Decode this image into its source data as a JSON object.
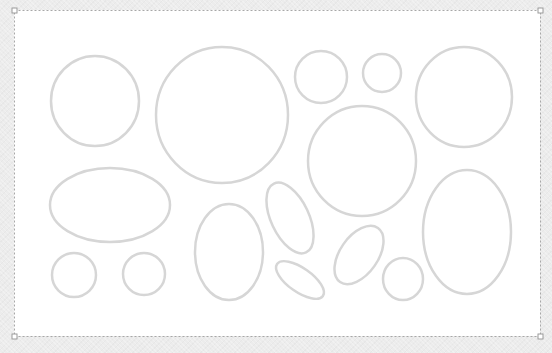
{
  "canvas": {
    "width": 552,
    "height": 353,
    "background": "#ececec",
    "slide": {
      "x": 14,
      "y": 10,
      "width": 526,
      "height": 326,
      "fill": "#ffffff",
      "border_color": "#a8a8a8",
      "handle_color": "#9a9a9a"
    },
    "shape_style": {
      "stroke": "#d6d6d6",
      "stroke_width": 2.5,
      "fill": "none"
    },
    "shapes": [
      {
        "name": "circle-top-left",
        "type": "ellipse",
        "cx": 95,
        "cy": 101,
        "rx": 44,
        "ry": 45,
        "rotate": 0
      },
      {
        "name": "circle-large",
        "type": "ellipse",
        "cx": 222,
        "cy": 115,
        "rx": 66,
        "ry": 68,
        "rotate": 0
      },
      {
        "name": "circle-small-top",
        "type": "ellipse",
        "cx": 321,
        "cy": 77,
        "rx": 26,
        "ry": 26,
        "rotate": 0
      },
      {
        "name": "circle-tiny-top",
        "type": "ellipse",
        "cx": 382,
        "cy": 73,
        "rx": 19,
        "ry": 19,
        "rotate": 0
      },
      {
        "name": "circle-top-right",
        "type": "ellipse",
        "cx": 464,
        "cy": 97,
        "rx": 48,
        "ry": 50,
        "rotate": 0
      },
      {
        "name": "circle-middle",
        "type": "ellipse",
        "cx": 362,
        "cy": 161,
        "rx": 54,
        "ry": 55,
        "rotate": 0
      },
      {
        "name": "ellipse-horizontal",
        "type": "ellipse",
        "cx": 110,
        "cy": 205,
        "rx": 60,
        "ry": 37,
        "rotate": 0
      },
      {
        "name": "circle-small-bottom-1",
        "type": "ellipse",
        "cx": 74,
        "cy": 275,
        "rx": 22,
        "ry": 22,
        "rotate": 0
      },
      {
        "name": "circle-small-bottom-2",
        "type": "ellipse",
        "cx": 144,
        "cy": 274,
        "rx": 21,
        "ry": 21,
        "rotate": 0
      },
      {
        "name": "ellipse-vertical",
        "type": "ellipse",
        "cx": 229,
        "cy": 252,
        "rx": 34,
        "ry": 48,
        "rotate": 0
      },
      {
        "name": "ellipse-tilted-upper",
        "type": "ellipse",
        "cx": 290,
        "cy": 218,
        "rx": 19,
        "ry": 38,
        "rotate": -25
      },
      {
        "name": "ellipse-tilted-lower",
        "type": "ellipse",
        "cx": 300,
        "cy": 280,
        "rx": 28,
        "ry": 12,
        "rotate": 35
      },
      {
        "name": "ellipse-tilted-right",
        "type": "ellipse",
        "cx": 359,
        "cy": 255,
        "rx": 19,
        "ry": 33,
        "rotate": 35
      },
      {
        "name": "circle-small-bottom-3",
        "type": "ellipse",
        "cx": 403,
        "cy": 279,
        "rx": 20,
        "ry": 21,
        "rotate": 0
      },
      {
        "name": "ellipse-tall-right",
        "type": "ellipse",
        "cx": 467,
        "cy": 232,
        "rx": 44,
        "ry": 62,
        "rotate": 0
      }
    ]
  }
}
